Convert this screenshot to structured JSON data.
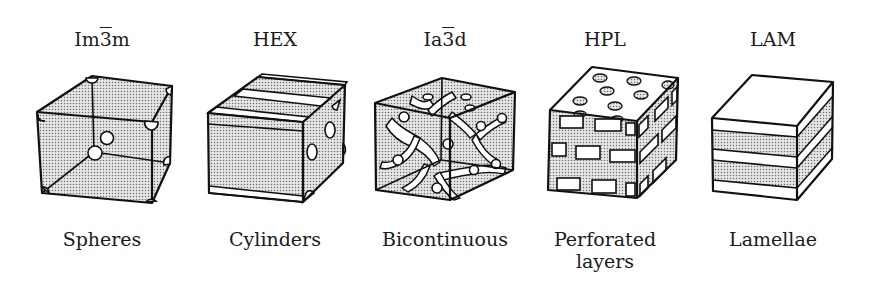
{
  "figure": {
    "phases": [
      {
        "id": "im3m",
        "symbol_prefix": "Im",
        "symbol_bar": "3",
        "symbol_suffix": "m",
        "name_lines": [
          "Spheres"
        ]
      },
      {
        "id": "hex",
        "symbol_prefix": "HEX",
        "symbol_bar": "",
        "symbol_suffix": "",
        "name_lines": [
          "Cylinders"
        ]
      },
      {
        "id": "ia3d",
        "symbol_prefix": "Ia",
        "symbol_bar": "3",
        "symbol_suffix": "d",
        "name_lines": [
          "Bicontinuous"
        ]
      },
      {
        "id": "hpl",
        "symbol_prefix": "HPL",
        "symbol_bar": "",
        "symbol_suffix": "",
        "name_lines": [
          "Perforated",
          "layers"
        ]
      },
      {
        "id": "lam",
        "symbol_prefix": "LAM",
        "symbol_bar": "",
        "symbol_suffix": "",
        "name_lines": [
          "Lamellae"
        ]
      }
    ],
    "colors": {
      "background": "#ffffff",
      "stroke": "#111111",
      "stipple": "#9a9a9a"
    }
  }
}
